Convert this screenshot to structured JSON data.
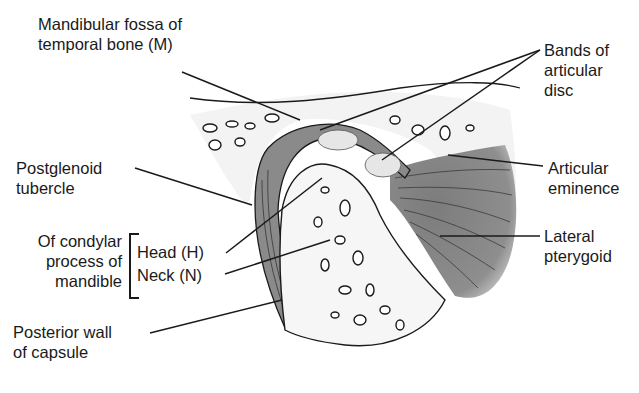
{
  "figure": {
    "labels": {
      "mandibular_fossa": [
        "Mandibular fossa of",
        "temporal bone (M)"
      ],
      "bands_disc": [
        "Bands of",
        "articular",
        "disc"
      ],
      "postglenoid": [
        "Postglenoid",
        "tubercle"
      ],
      "articular_eminence": [
        "Articular",
        "eminence"
      ],
      "condylar_group": [
        "Of condylar",
        "process of",
        "mandible"
      ],
      "head": "Head (H)",
      "neck": "Neck (N)",
      "lateral_pterygoid": [
        "Lateral",
        "pterygoid"
      ],
      "posterior_wall": [
        "Posterior wall",
        "of capsule"
      ]
    },
    "colors": {
      "bone_fill": "#f4f4f4",
      "muscle_fill": "#8a8a8a",
      "ink": "#1a1a1a",
      "disc_fill": "#e2e2e2"
    }
  }
}
